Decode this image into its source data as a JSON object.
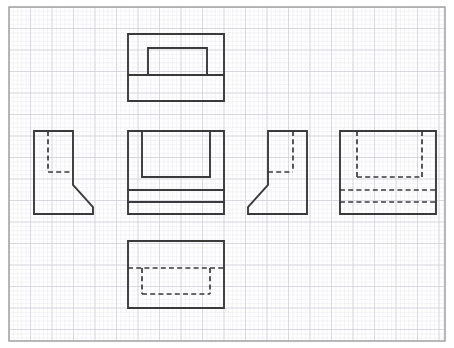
{
  "sheet": {
    "title": "Orthographic Projection Multiview Drawing",
    "width": 454,
    "height": 348,
    "background_color": "#ffffff",
    "border": {
      "name": "sheet-border",
      "x": 9,
      "y": 7,
      "width": 436,
      "height": 334,
      "stroke_color": "#9a9a9a",
      "stroke_width": 1.4
    }
  },
  "grid": {
    "minor": {
      "spacing": 4.3,
      "color": "#e8e8ee",
      "stroke_width": 0.5,
      "visible": true
    },
    "major": {
      "spacing": 21.5,
      "color": "#d2d2dc",
      "stroke_width": 0.8,
      "visible": true
    },
    "origin_x": 9,
    "origin_y": 7
  },
  "style": {
    "visible_edge_color": "#3a3a3a",
    "visible_edge_width": 1.9,
    "hidden_edge_color": "#3a3a3a",
    "hidden_edge_width": 1.7,
    "hidden_dash_pattern": "5,3.2"
  },
  "views": [
    {
      "id": "top-view",
      "name": "top-view",
      "label": "Top View",
      "position": "upper-center",
      "bounds": {
        "x": 128,
        "y": 34,
        "width": 96,
        "height": 67
      },
      "visible_lines": [
        {
          "name": "outline-rect",
          "points": "128,34 224,34 224,101 128,101 128,34"
        },
        {
          "name": "inner-u-shape",
          "points": "148,75 148,48 207,48 207,75"
        },
        {
          "name": "horizontal-divider",
          "points": "128,75 224,75"
        }
      ],
      "hidden_lines": []
    },
    {
      "id": "front-view",
      "name": "front-view",
      "label": "Front View",
      "position": "center",
      "bounds": {
        "x": 128,
        "y": 131,
        "width": 96,
        "height": 83
      },
      "visible_lines": [
        {
          "name": "outline-rect",
          "points": "128,131 224,131 224,214 128,214 128,131"
        },
        {
          "name": "inner-inverted-u",
          "points": "142,131 142,177 210,177 210,131"
        },
        {
          "name": "slab-line-upper",
          "points": "128,190 224,190"
        },
        {
          "name": "slab-line-lower",
          "points": "128,202 224,202"
        }
      ],
      "hidden_lines": []
    },
    {
      "id": "left-side-view",
      "name": "left-side-view",
      "label": "Left Side View",
      "position": "left",
      "bounds": {
        "x": 34,
        "y": 131,
        "width": 59,
        "height": 83
      },
      "visible_lines": [
        {
          "name": "profile-outline",
          "points": "34,131 73,131 73,185 93,207 93,214 34,214 34,131"
        }
      ],
      "hidden_lines": [
        {
          "name": "hidden-vertical",
          "points": "48,131 48,172"
        },
        {
          "name": "hidden-horizontal",
          "points": "48,172 73,172"
        }
      ]
    },
    {
      "id": "right-side-view",
      "name": "right-side-view",
      "label": "Right Side View",
      "position": "right",
      "bounds": {
        "x": 248,
        "y": 131,
        "width": 59,
        "height": 83
      },
      "visible_lines": [
        {
          "name": "profile-outline",
          "points": "307,131 268,131 268,185 248,207 248,214 307,214 307,131"
        }
      ],
      "hidden_lines": [
        {
          "name": "hidden-vertical",
          "points": "293,131 293,172"
        },
        {
          "name": "hidden-horizontal",
          "points": "268,172 293,172"
        }
      ]
    },
    {
      "id": "rear-view",
      "name": "rear-view",
      "label": "Rear View",
      "position": "far-right",
      "bounds": {
        "x": 340,
        "y": 131,
        "width": 96,
        "height": 83
      },
      "visible_lines": [
        {
          "name": "outline-rect",
          "points": "340,131 436,131 436,214 340,214 340,131"
        }
      ],
      "hidden_lines": [
        {
          "name": "hidden-left-vertical",
          "points": "357,131 357,177"
        },
        {
          "name": "hidden-right-vertical",
          "points": "422,131 422,177"
        },
        {
          "name": "hidden-inner-bottom",
          "points": "357,177 422,177"
        },
        {
          "name": "hidden-slab-upper",
          "points": "340,190 436,190"
        },
        {
          "name": "hidden-slab-lower",
          "points": "340,202 436,202"
        }
      ]
    },
    {
      "id": "bottom-view",
      "name": "bottom-view",
      "label": "Bottom View",
      "position": "lower-center",
      "bounds": {
        "x": 128,
        "y": 241,
        "width": 96,
        "height": 67
      },
      "visible_lines": [
        {
          "name": "outline-rect",
          "points": "128,241 224,241 224,308 128,308 128,241"
        }
      ],
      "hidden_lines": [
        {
          "name": "hidden-top-horizontal",
          "points": "128,268 224,268"
        },
        {
          "name": "hidden-left-vertical",
          "points": "142,268 142,294"
        },
        {
          "name": "hidden-right-vertical",
          "points": "210,268 210,294"
        },
        {
          "name": "hidden-bottom-horizontal",
          "points": "142,294 210,294"
        }
      ]
    }
  ]
}
